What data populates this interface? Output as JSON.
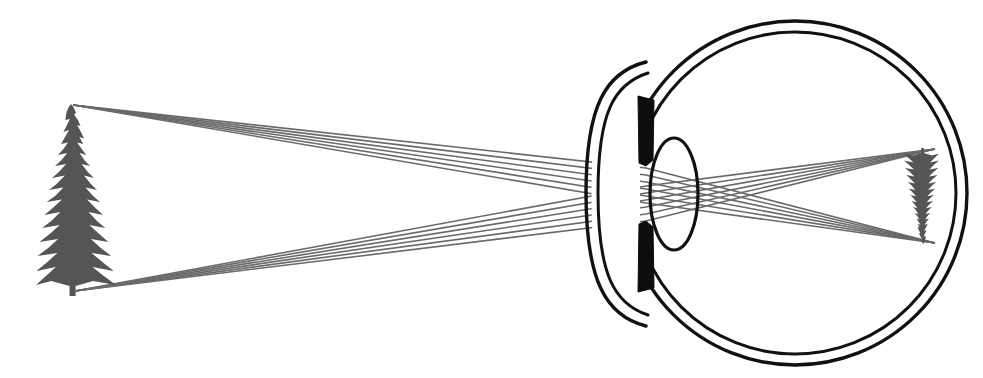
{
  "canvas": {
    "width": 983,
    "height": 378,
    "background": "#ffffff",
    "title": "Image formation by the human eye"
  },
  "colors": {
    "background": "#ffffff",
    "ink_black": "#111111",
    "tree_fill": "#555555",
    "ray_stroke": "#6a6a6a",
    "iris_fill": "#0d0d0d",
    "sclera_stroke": "#111111",
    "lens_stroke": "#111111",
    "cornea_stroke": "#111111"
  },
  "scene": {
    "object": {
      "label": "Fir tree (object)",
      "kind": "conifer-silhouette",
      "orientation": "upright",
      "fill": "#555555",
      "bbox": {
        "x": 36,
        "y": 104,
        "width": 80,
        "height": 192
      },
      "apex": {
        "x": 73,
        "y": 105
      },
      "base": {
        "x": 75,
        "y": 291
      }
    },
    "image": {
      "label": "Inverted retinal image",
      "kind": "conifer-silhouette",
      "orientation": "inverted",
      "fill": "#555555",
      "bbox": {
        "x": 903,
        "y": 148,
        "width": 36,
        "height": 96
      },
      "apex": {
        "x": 935,
        "y": 243
      },
      "base": {
        "x": 935,
        "y": 149
      }
    },
    "eye": {
      "label": "Eyeball (sclera)",
      "center": {
        "x": 795,
        "y": 193
      },
      "outer_radius": 172,
      "inner_radius": 161,
      "stroke_width": 3.4,
      "cornea": {
        "label": "Cornea",
        "apex_x": 600,
        "top_y": 62,
        "bottom_y": 326,
        "outer_bulge": 625,
        "stroke_width": 3.4
      },
      "iris": {
        "label": "Iris",
        "fill": "#0d0d0d",
        "x_left": 638,
        "x_right": 654,
        "upper_top_y": 96,
        "upper_bottom_y": 165,
        "lower_top_y": 222,
        "lower_bottom_y": 292,
        "pupil_gap_top": 165,
        "pupil_gap_bottom": 222
      },
      "lens": {
        "label": "Crystalline lens",
        "center": {
          "x": 674,
          "y": 194
        },
        "rx": 24,
        "ry": 56,
        "stroke_width": 3.2
      },
      "retina": {
        "label": "Retina (image plane)",
        "x": 936
      }
    }
  },
  "chart_data": {
    "type": "scatter",
    "title": "Ray diagram: image formation by the human eye",
    "xlabel": "",
    "ylabel": "",
    "xlim": [
      0,
      983
    ],
    "ylim": [
      378,
      0
    ],
    "grid": false,
    "legend": "none",
    "annotations": [
      "object: upright fir tree at left",
      "image: inverted fir tree on retina at right",
      "rays cross inside the eye producing inversion"
    ],
    "series": [
      {
        "name": "rays-from-tree-apex",
        "origin": {
          "x": 73,
          "y": 105
        },
        "focus": {
          "x": 935,
          "y": 243
        },
        "count": 6,
        "pupil_x": 646,
        "pupil_y_values": [
          168,
          175,
          182,
          189,
          196,
          203
        ]
      },
      {
        "name": "rays-from-tree-base",
        "origin": {
          "x": 75,
          "y": 291
        },
        "focus": {
          "x": 935,
          "y": 149
        },
        "count": 6,
        "pupil_x": 646,
        "pupil_y_values": [
          186,
          193,
          200,
          207,
          214,
          221
        ]
      }
    ]
  },
  "tree_outline": "M 40.0 8.0 L 43.0 3.0 L 46.0 0.0 L 49.5 3.5 L 52.5 9.0 L 50.0 10.5 L 55.0 16.0 L 58.5 22.0 L 54.0 21.0 L 59.0 28.0 L 63.0 34.5 L 57.0 33.0 L 62.0 40.0 L 54.0 38.5 L 60.0 45.0 L 66.0 51.0 L 57.0 49.0 L 64.0 56.5 L 71.0 62.0 L 60.0 60.0 L 68.0 68.0 L 76.0 74.0 L 63.0 71.5 L 72.0 80.0 L 80.0 86.0 L 65.0 83.5 L 75.0 92.0 L 84.0 98.0 L 67.0 95.5 L 78.0 104.0 L 88.0 111.0 L 69.0 108.0 L 80.0 117.0 L 91.0 124.0 L 70.0 121.0 L 83.0 130.0 L 95.0 138.0 L 72.0 135.0 L 85.0 144.0 L 99.0 152.0 L 73.0 149.0 L 87.0 158.0 L 102.0 167.0 L 74.0 163.0 L 89.0 172.0 L 105.0 181.0 L 75.0 177.0 L 52.0 182.0 L 52.0 192.0 L 44.0 192.0 L 44.0 182.0 L 20.0 177.0 L 0.0 181.0 L 13.0 172.0 L 26.0 163.0 L 0.5 167.0 L 15.0 158.0 L 28.0 149.0 L 2.0 152.0 L 16.0 144.0 L 29.0 135.0 L 4.5 138.0 L 18.0 130.0 L 31.0 121.0 L 8.0 124.0 L 20.0 117.0 L 32.0 108.0 L 11.0 111.0 L 22.0 104.0 L 34.0 95.5 L 14.0 98.0 L 25.0 92.0 L 36.0 83.5 L 17.0 86.0 L 27.0 80.0 L 38.0 71.5 L 21.0 74.0 L 30.0 68.0 L 39.5 60.0 L 25.0 62.0 L 33.0 56.5 L 41.0 49.0 L 29.0 51.0 L 36.0 45.0 L 42.0 38.5 L 33.0 40.0 L 38.0 33.0 L 43.5 26.0 L 36.0 28.0 L 40.0 22.0 L 44.5 15.0 L 38.5 16.0 Z"
}
